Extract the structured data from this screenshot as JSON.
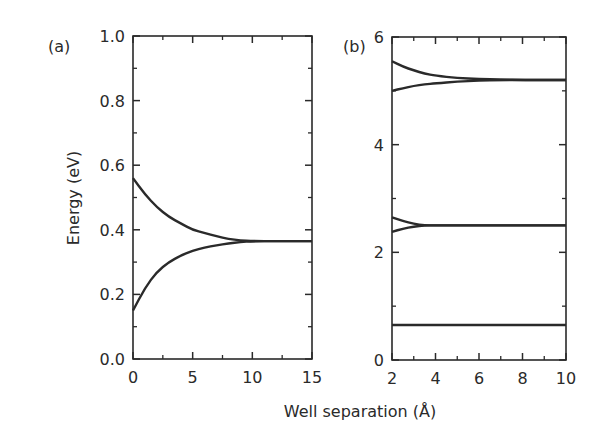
{
  "chart_data": [
    {
      "panel_label": "(a)",
      "type": "line",
      "xlabel": "Well separation (Å)",
      "ylabel": "Energy (eV)",
      "xlim": [
        0,
        15
      ],
      "ylim": [
        0.0,
        1.0
      ],
      "xticks": [
        "0",
        "5",
        "10",
        "15"
      ],
      "yticks": [
        "0.0",
        "0.2",
        "0.4",
        "0.6",
        "0.8",
        "1.0"
      ],
      "grid": false,
      "series": [
        {
          "name": "upper level",
          "x": [
            0,
            1,
            2,
            3,
            4,
            5,
            6,
            7,
            8,
            9,
            10,
            12,
            15
          ],
          "y": [
            0.56,
            0.51,
            0.47,
            0.44,
            0.42,
            0.4,
            0.39,
            0.38,
            0.372,
            0.367,
            0.365,
            0.365,
            0.365
          ]
        },
        {
          "name": "lower level",
          "x": [
            0,
            1,
            2,
            3,
            4,
            5,
            6,
            7,
            8,
            9,
            10,
            12,
            15
          ],
          "y": [
            0.15,
            0.22,
            0.27,
            0.3,
            0.32,
            0.335,
            0.345,
            0.352,
            0.358,
            0.362,
            0.365,
            0.365,
            0.365
          ]
        }
      ]
    },
    {
      "panel_label": "(b)",
      "type": "line",
      "xlabel": "Well separation (Å)",
      "ylabel": "Energy (eV)",
      "xlim": [
        2,
        10
      ],
      "ylim": [
        0,
        6
      ],
      "xticks": [
        "2",
        "4",
        "6",
        "8",
        "10"
      ],
      "yticks": [
        "0",
        "2",
        "4",
        "6"
      ],
      "grid": false,
      "series": [
        {
          "name": "level 3 upper",
          "x": [
            2,
            2.5,
            3,
            3.5,
            4,
            5,
            6,
            7,
            8,
            10
          ],
          "y": [
            5.55,
            5.45,
            5.38,
            5.32,
            5.28,
            5.24,
            5.22,
            5.21,
            5.2,
            5.2
          ]
        },
        {
          "name": "level 3 lower",
          "x": [
            2,
            2.5,
            3,
            3.5,
            4,
            5,
            6,
            7,
            8,
            10
          ],
          "y": [
            5.0,
            5.05,
            5.09,
            5.12,
            5.14,
            5.17,
            5.19,
            5.2,
            5.2,
            5.2
          ]
        },
        {
          "name": "level 2 upper",
          "x": [
            2,
            2.5,
            3,
            3.5,
            4,
            10
          ],
          "y": [
            2.65,
            2.58,
            2.53,
            2.5,
            2.5,
            2.5
          ]
        },
        {
          "name": "level 2 lower",
          "x": [
            2,
            2.5,
            3,
            3.5,
            4,
            10
          ],
          "y": [
            2.38,
            2.44,
            2.48,
            2.5,
            2.5,
            2.5
          ]
        },
        {
          "name": "level 1",
          "x": [
            2,
            10
          ],
          "y": [
            0.65,
            0.65
          ]
        }
      ]
    }
  ],
  "labels": {
    "panel_a": "(a)",
    "panel_b": "(b)",
    "xlabel": "Well separation (Å)",
    "ylabel": "Energy (eV)"
  }
}
